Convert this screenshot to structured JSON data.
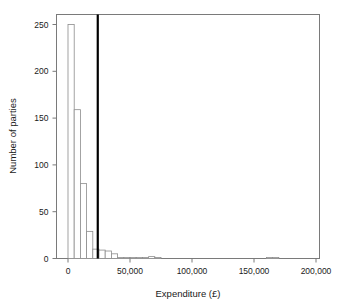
{
  "chart_data": {
    "type": "bar",
    "title": "",
    "subtitle": "",
    "xlabel": "Expenditure (£)",
    "ylabel": "Number of parties",
    "xlim": [
      -2000,
      202000
    ],
    "ylim": [
      0,
      262
    ],
    "grid": false,
    "legend": null,
    "bin_width": 5000,
    "xticks": [
      0,
      50000,
      100000,
      150000,
      200000
    ],
    "xticklabels": [
      "0",
      "50,000",
      "100,000",
      "150,000",
      "200,000"
    ],
    "yticks": [
      0,
      50,
      100,
      150,
      200,
      250
    ],
    "yticklabels": [
      "0",
      "50",
      "100",
      "150",
      "200",
      "250"
    ],
    "bin_starts": [
      0,
      5000,
      10000,
      15000,
      20000,
      25000,
      30000,
      35000,
      40000,
      45000,
      50000,
      55000,
      60000,
      65000,
      70000,
      75000,
      80000,
      85000,
      90000,
      95000,
      100000,
      105000,
      110000,
      115000,
      120000,
      125000,
      130000,
      135000,
      140000,
      145000,
      150000,
      155000,
      160000,
      165000
    ],
    "values": [
      250,
      159,
      80,
      29,
      10,
      9,
      8,
      5,
      1,
      1,
      1,
      1,
      1,
      2,
      1,
      0,
      0,
      0,
      0,
      0,
      0,
      0,
      0,
      0,
      0,
      0,
      0,
      0,
      0,
      0,
      0,
      0,
      1,
      1
    ],
    "annotations": [
      {
        "name": "mean-line",
        "type": "vline",
        "x": 24000,
        "color": "#000000",
        "linewidth": 2.2
      }
    ],
    "bar_style": {
      "facecolor": "#ffffff",
      "edgecolor": "#8c8c8c"
    },
    "frame_color": "#7a7a7a"
  },
  "axes": {
    "x_axis_name": "expenditure-axis",
    "y_axis_name": "number-of-parties-axis"
  }
}
